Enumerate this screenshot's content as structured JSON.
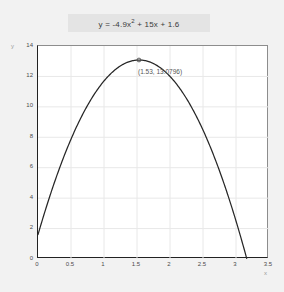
{
  "chart_data": {
    "type": "line",
    "title_parts": {
      "before": "y = -4.9x",
      "exponent": "2",
      "after": " + 15x + 1.6"
    },
    "xlabel": "x",
    "ylabel": "y",
    "xlim": [
      0,
      3.5
    ],
    "ylim": [
      0,
      14
    ],
    "grid": true,
    "legend": "none",
    "equation": {
      "a": -4.9,
      "b": 15,
      "c": 1.6
    },
    "xticks": [
      "0",
      "0.5",
      "1",
      "1.5",
      "2",
      "2.5",
      "3",
      "3.5"
    ],
    "xtick_values": [
      0,
      0.5,
      1,
      1.5,
      2,
      2.5,
      3,
      3.5
    ],
    "yticks": [
      "0",
      "2",
      "4",
      "6",
      "8",
      "10",
      "12",
      "14"
    ],
    "ytick_values": [
      0,
      2,
      4,
      6,
      8,
      10,
      12,
      14
    ],
    "annotations": [
      {
        "label": "(1.53, 13.0796)",
        "x": 1.53,
        "y": 13.0796,
        "marker": "circle"
      }
    ],
    "series": [
      {
        "name": "y = -4.9x^2 + 15x + 1.6",
        "color": "#262626",
        "x": [
          0,
          0.1,
          0.2,
          0.3,
          0.4,
          0.5,
          0.6,
          0.7,
          0.8,
          0.9,
          1.0,
          1.1,
          1.2,
          1.3,
          1.4,
          1.5,
          1.53,
          1.6,
          1.7,
          1.8,
          1.9,
          2.0,
          2.1,
          2.2,
          2.3,
          2.4,
          2.5,
          2.6,
          2.7,
          2.8,
          2.9,
          3.0,
          3.1,
          3.1616
        ],
        "values": [
          1.6,
          3.051,
          4.404,
          5.659,
          6.816,
          7.875,
          8.836,
          9.699,
          10.464,
          11.131,
          11.7,
          12.171,
          12.544,
          12.819,
          12.996,
          13.075,
          13.0796,
          13.056,
          12.939,
          12.724,
          12.411,
          12.0,
          11.491,
          10.884,
          10.179,
          9.376,
          8.475,
          7.476,
          6.379,
          5.184,
          3.891,
          2.5,
          1.011,
          0.0
        ]
      }
    ],
    "key_points": {
      "y_intercept": 1.6,
      "vertex_x": 1.53,
      "vertex_y": 13.0796,
      "positive_root": 3.1616
    }
  }
}
